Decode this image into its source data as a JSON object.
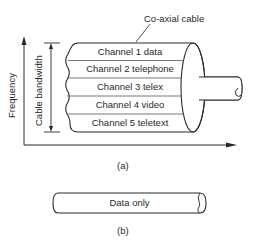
{
  "diagram": {
    "part_a": {
      "cable_label": "Co-axial cable",
      "y_axis_label": "Frequency",
      "bandwidth_label": "Cable bandwidth",
      "channels": [
        {
          "label": "Channel 1 data"
        },
        {
          "label": "Channel 2 telephone"
        },
        {
          "label": "Channel 3 telex"
        },
        {
          "label": "Channel 4 video"
        },
        {
          "label": "Channel 5 teletext"
        }
      ],
      "caption": "(a)"
    },
    "part_b": {
      "cable_label": "Data only",
      "caption": "(b)"
    },
    "colors": {
      "line": "#2a2a2a",
      "background": "#ffffff"
    }
  }
}
